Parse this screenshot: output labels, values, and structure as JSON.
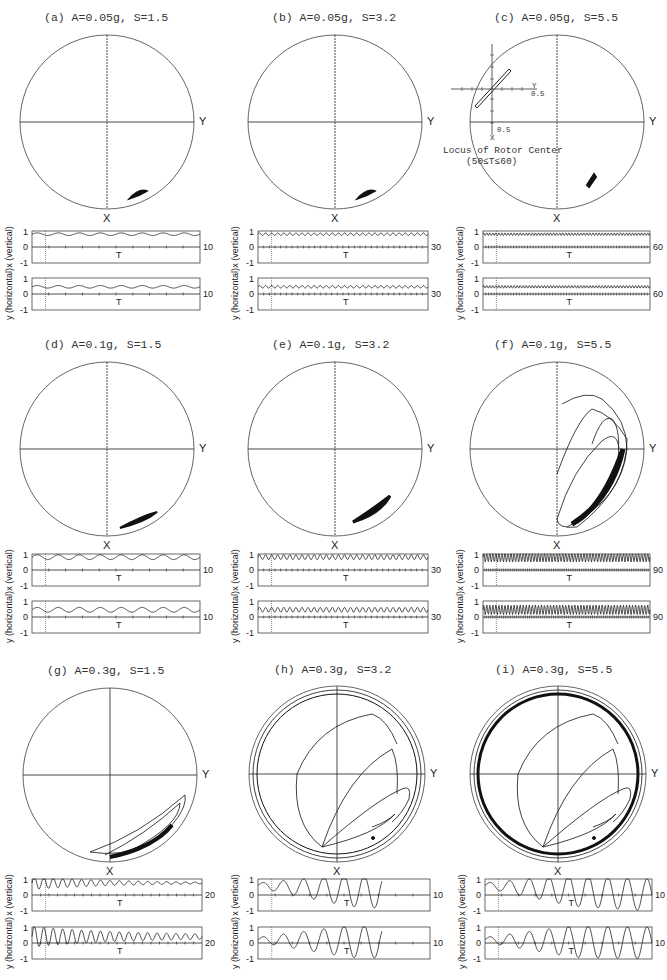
{
  "figure": {
    "panels": [
      {
        "id": "a",
        "title": "(a) A=0.05g, S=1.5",
        "x_axis_label": "X",
        "y_axis_label": "Y",
        "t_end": "10",
        "plot_x_label": "x (vertical)",
        "plot_y_label": "y (horizontal)",
        "t_label": "T",
        "yticks": [
          "1",
          "0",
          "-1"
        ]
      },
      {
        "id": "b",
        "title": "(b) A=0.05g, S=3.2",
        "x_axis_label": "X",
        "y_axis_label": "Y",
        "t_end": "30",
        "plot_x_label": "x (vertical)",
        "plot_y_label": "y (horizontal)",
        "t_label": "T",
        "yticks": [
          "1",
          "0",
          "-1"
        ]
      },
      {
        "id": "c",
        "title": "(c) A=0.05g, S=5.5",
        "x_axis_label": "X",
        "y_axis_label": "Y",
        "t_end": "60",
        "plot_x_label": "x (vertical)",
        "plot_y_label": "y (horizontal)",
        "t_label": "T",
        "yticks": [
          "1",
          "0",
          "-1"
        ],
        "inset": {
          "caption_line1": "Locus of Rotor Center",
          "caption_line2": "(50≤T≤60)",
          "y_tick": "0.5",
          "x_tick": "0.5",
          "y_axis": "Y",
          "x_axis": "X"
        }
      },
      {
        "id": "d",
        "title": "(d) A=0.1g, S=1.5",
        "x_axis_label": "X",
        "y_axis_label": "Y",
        "t_end": "10",
        "plot_x_label": "x (vertical)",
        "plot_y_label": "y (horizontal)",
        "t_label": "T",
        "yticks": [
          "1",
          "0",
          "-1"
        ]
      },
      {
        "id": "e",
        "title": "(e) A=0.1g, S=3.2",
        "x_axis_label": "X",
        "y_axis_label": "Y",
        "t_end": "30",
        "plot_x_label": "x (vertical)",
        "plot_y_label": "y (horizontal)",
        "t_label": "T",
        "yticks": [
          "1",
          "0",
          "-1"
        ]
      },
      {
        "id": "f",
        "title": "(f) A=0.1g, S=5.5",
        "x_axis_label": "X",
        "y_axis_label": "Y",
        "t_end": "90",
        "plot_x_label": "x (vertical)",
        "plot_y_label": "y (horizontal)",
        "t_label": "T",
        "yticks": [
          "1",
          "0",
          "-1"
        ]
      },
      {
        "id": "g",
        "title": "(g) A=0.3g, S=1.5",
        "x_axis_label": "X",
        "y_axis_label": "Y",
        "t_end": "20",
        "plot_x_label": "x (vertical)",
        "plot_y_label": "y (horizontal)",
        "t_label": "T",
        "yticks": [
          "1",
          "0",
          "-1"
        ]
      },
      {
        "id": "h",
        "title": "(h) A=0.3g, S=3.2",
        "x_axis_label": "X",
        "y_axis_label": "Y",
        "t_end": "10",
        "plot_x_label": "x (vertical)",
        "plot_y_label": "y (horizontal)",
        "t_label": "T",
        "yticks": [
          "1",
          "0",
          "-1"
        ]
      },
      {
        "id": "i",
        "title": "(i) A=0.3g, S=5.5",
        "x_axis_label": "X",
        "y_axis_label": "Y",
        "t_end": "10",
        "plot_x_label": "x (vertical)",
        "plot_y_label": "y (horizontal)",
        "t_label": "T",
        "yticks": [
          "1",
          "0",
          "-1"
        ]
      }
    ]
  },
  "colors": {
    "ink": "#222222",
    "paper": "#ffffff",
    "grey": "#555555"
  }
}
